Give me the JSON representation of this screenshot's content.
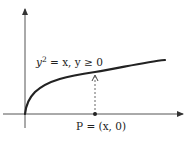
{
  "diagram": {
    "title": "",
    "curve_label": {
      "lhs_var": "y",
      "exponent": "2",
      "rest": " = x, y ≥ 0"
    },
    "point_label": "P = (x, 0)",
    "colors": {
      "ink": "#222222",
      "axis": "#555555",
      "background": "#ffffff"
    }
  }
}
